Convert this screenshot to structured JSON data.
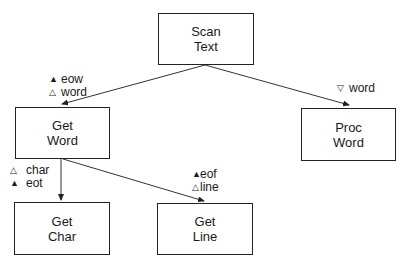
{
  "diagram": {
    "type": "structure-chart",
    "nodes": [
      {
        "id": "scan_text",
        "line1": "Scan",
        "line2": "Text"
      },
      {
        "id": "get_word",
        "line1": "Get",
        "line2": "Word"
      },
      {
        "id": "proc_word",
        "line1": "Proc",
        "line2": "Word"
      },
      {
        "id": "get_char",
        "line1": "Get",
        "line2": "Char"
      },
      {
        "id": "get_line",
        "line1": "Get",
        "line2": "Line"
      }
    ],
    "edges": [
      {
        "from": "scan_text",
        "to": "get_word"
      },
      {
        "from": "scan_text",
        "to": "proc_word"
      },
      {
        "from": "get_word",
        "to": "get_char"
      },
      {
        "from": "get_word",
        "to": "get_line"
      }
    ],
    "labels": {
      "scan_to_getword": [
        {
          "glyph": "▲",
          "text": "eow"
        },
        {
          "glyph": "△",
          "text": "word"
        }
      ],
      "scan_to_procword": [
        {
          "glyph": "▽",
          "text": "word"
        }
      ],
      "getword_to_getchar": [
        {
          "glyph": "△",
          "text": "char"
        },
        {
          "glyph": "▲",
          "text": "eot"
        }
      ],
      "getword_to_getline": [
        {
          "glyph": "▲",
          "text": "eof"
        },
        {
          "glyph": "△",
          "text": "line"
        }
      ]
    },
    "colors": {
      "stroke": "#222222",
      "background": "#ffffff"
    }
  }
}
